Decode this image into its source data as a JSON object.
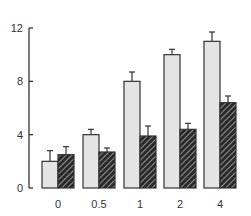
{
  "chart_data": {
    "type": "bar",
    "title": "",
    "xlabel": "",
    "ylabel": "",
    "categories": [
      "0",
      "0.5",
      "1",
      "2",
      "4"
    ],
    "series": [
      {
        "name": "light",
        "color": "#e4e4e4",
        "pattern": "solid",
        "values": [
          2.0,
          4.0,
          8.0,
          10.0,
          11.0
        ],
        "errors": [
          0.8,
          0.4,
          0.7,
          0.4,
          0.7
        ]
      },
      {
        "name": "dark",
        "color": "#2a2a2a",
        "pattern": "diagonal-hatch",
        "values": [
          2.5,
          2.7,
          3.9,
          4.4,
          6.4
        ],
        "errors": [
          0.6,
          0.3,
          0.75,
          0.45,
          0.5
        ]
      }
    ],
    "ylim": [
      0,
      12
    ],
    "yticks": [
      0,
      4,
      8,
      12
    ],
    "grid": false,
    "legend": null
  },
  "axis": {
    "ytick_labels": [
      "0",
      "4",
      "8",
      "12"
    ]
  }
}
